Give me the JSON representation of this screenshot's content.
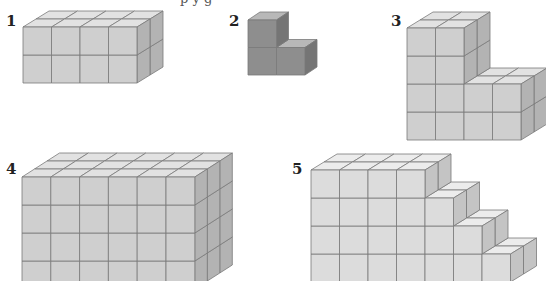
{
  "header": {
    "clipped_caption": "p         y        g"
  },
  "figures": [
    {
      "label": "1",
      "x": 6,
      "y": 14,
      "shape": "4 wide × 2 deep × 2 tall block",
      "cubes": 16
    },
    {
      "label": "2",
      "x": 229,
      "y": 14,
      "shape": "L-shaped: 2 bottom, 1 top-left",
      "cubes": 3
    },
    {
      "label": "3",
      "x": 391,
      "y": 14,
      "shape": "step: left 2×4 tall, right 2×2 tall, depth 2",
      "cubes": 24
    },
    {
      "label": "4",
      "x": 6,
      "y": 162,
      "shape": "6 wide × 3 deep × 4 tall block",
      "cubes": 72
    },
    {
      "label": "5",
      "x": 292,
      "y": 162,
      "shape": "staircase: rows 4,5,6,7 wide, depth 2",
      "cubes": 44
    }
  ],
  "colors": {
    "fig_light_front": "#cfcfcf",
    "fig_light_top": "#e2e2e2",
    "fig_light_side": "#b3b3b3",
    "fig_dark_front": "#8e8e8e",
    "fig_dark_top": "#b8b8b8",
    "fig_dark_side": "#757575",
    "fig5_front": "#dcdcdc",
    "fig5_top": "#ececec",
    "fig5_side": "#c4c4c4",
    "edge": "#7a7a7a"
  }
}
